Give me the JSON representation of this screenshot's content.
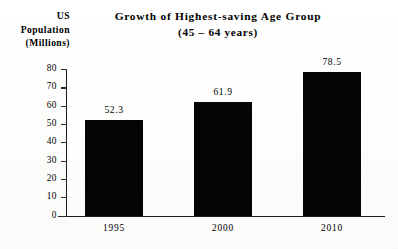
{
  "chart_data": {
    "type": "bar",
    "title": "Growth of Highest-saving Age Group",
    "subtitle": "(45 – 64 years)",
    "xlabel": "",
    "ylabel": "US Population (Millions)",
    "ylabel_lines": [
      "US",
      "Population",
      "(Millions)"
    ],
    "categories": [
      "1995",
      "2000",
      "2010"
    ],
    "values": [
      52.3,
      61.9,
      78.5
    ],
    "value_labels": [
      "52.3",
      "61.9",
      "78.5"
    ],
    "ylim": [
      0,
      80
    ],
    "ytick_step": 10,
    "ytick_labels": [
      "80",
      "70",
      "60",
      "50",
      "40",
      "30",
      "20",
      "10",
      "0"
    ],
    "ytick_values": [
      80,
      70,
      60,
      50,
      40,
      30,
      20,
      10,
      0
    ],
    "grid": false,
    "legend": false,
    "bar_color": "#050505",
    "axis_color": "#1b1b1b",
    "background_color": "#fcfcfb"
  }
}
